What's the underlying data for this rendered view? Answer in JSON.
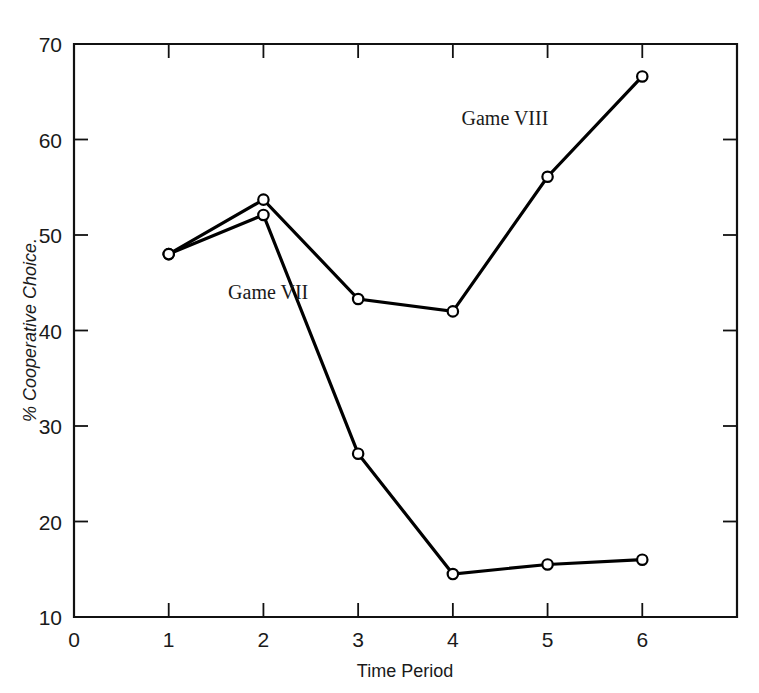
{
  "chart_data": {
    "type": "line",
    "title": "",
    "xlabel": "Time Period",
    "ylabel": "% Cooperative Choice.",
    "x": [
      1,
      2,
      3,
      4,
      5,
      6
    ],
    "xlim": [
      0,
      7
    ],
    "ylim": [
      10,
      70
    ],
    "xticks": [
      0,
      1,
      2,
      3,
      4,
      5,
      6
    ],
    "xtick_labels": [
      "0",
      "1",
      "2",
      "3",
      "4",
      "5",
      "6"
    ],
    "yticks": [
      10,
      20,
      30,
      40,
      50,
      60,
      70
    ],
    "ytick_labels": [
      "10",
      "20",
      "30",
      "40",
      "50",
      "60",
      "70"
    ],
    "grid": false,
    "legend": "inline-annotations",
    "marker": "open-circle",
    "line_color": "#000000",
    "marker_fill": "#ffffff",
    "series": [
      {
        "name": "Game VII",
        "label": "Game VII",
        "label_x": 2.05,
        "label_y": 43.3,
        "values": [
          48.0,
          52.1,
          27.1,
          14.5,
          15.5,
          16.0
        ]
      },
      {
        "name": "Game VIII",
        "label": "Game VIII",
        "label_x": 4.55,
        "label_y": 61.5,
        "values": [
          48.0,
          53.7,
          43.3,
          42.0,
          56.1,
          66.6
        ]
      }
    ]
  },
  "axes": {
    "x_axis_title": "Time Period",
    "y_axis_title": "% Cooperative Choice."
  },
  "annotations": {
    "game_seven": "Game VII",
    "game_eight": "Game VIII"
  },
  "colors": {
    "ink": "#111111",
    "background": "#ffffff",
    "marker_fill": "#ffffff"
  }
}
